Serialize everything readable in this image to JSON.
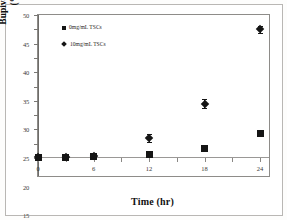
{
  "chart_data": {
    "type": "scatter",
    "title": "",
    "xlabel": "Time (hr)",
    "ylabel_line1": "Bupivacaine Delivered",
    "ylabel_line2": "(% of donor)",
    "xlim": [
      0,
      24
    ],
    "ylim": [
      0,
      50
    ],
    "xticks": [
      0,
      3,
      6,
      9,
      12,
      15,
      18,
      21,
      24
    ],
    "xtick_labels": [
      "0",
      "",
      "6",
      "",
      "12",
      "",
      "18",
      "",
      "24"
    ],
    "yticks": [
      0,
      5,
      10,
      15,
      20,
      25,
      30,
      35,
      40,
      45,
      50
    ],
    "ytick_labels": [
      "0",
      "5",
      "10",
      "15",
      "20",
      "25",
      "30",
      "35",
      "40",
      "45",
      "50"
    ],
    "grid": false,
    "legend_position": "upper left",
    "x": [
      0,
      3,
      6,
      12,
      18,
      24
    ],
    "series": [
      {
        "name": "0mg/mL TSCs",
        "marker": "square",
        "color": "#151515",
        "values": [
          0.2,
          0.3,
          0.6,
          1.2,
          3.3,
          8.6
        ],
        "errors": [
          0.1,
          0.1,
          0.4,
          0.5,
          0.3,
          0.3
        ]
      },
      {
        "name": "10mg/mL TSCs",
        "marker": "diamond",
        "color": "#151515",
        "values": [
          0.2,
          0.3,
          0.8,
          7.0,
          19.0,
          45.0
        ],
        "errors": [
          0.2,
          0.2,
          0.6,
          1.3,
          1.6,
          1.3
        ]
      }
    ]
  },
  "legend": {
    "entries": [
      {
        "label": "0mg/mL TSCs"
      },
      {
        "label": "10mg/mL TSCs"
      }
    ]
  },
  "axes": {
    "x_title": "Time (hr)",
    "y_title_line1": "Bupivacaine Delivered",
    "y_title_line2": "(% of donor)"
  }
}
